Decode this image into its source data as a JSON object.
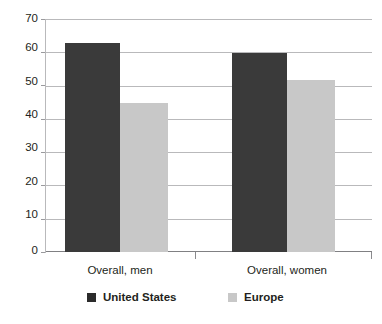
{
  "chart_data": {
    "type": "bar",
    "title": "",
    "xlabel": "",
    "ylabel": "",
    "ylim": [
      0,
      70
    ],
    "yticks": [
      0,
      10,
      20,
      30,
      40,
      50,
      60,
      70
    ],
    "grid": true,
    "legend_position": "bottom",
    "categories": [
      "Overall, men",
      "Overall, women"
    ],
    "series": [
      {
        "name": "United States",
        "color": "#3a3a3a",
        "values": [
          63,
          60
        ]
      },
      {
        "name": "Europe",
        "color": "#c8c8c8",
        "values": [
          45,
          52
        ]
      }
    ]
  },
  "axis": {
    "y_tick_labels": [
      "70",
      "60",
      "50",
      "40",
      "30",
      "20",
      "10",
      "0"
    ]
  },
  "categories": [
    {
      "label": "Overall, men"
    },
    {
      "label": "Overall, women"
    }
  ],
  "legend": {
    "items": [
      {
        "label": "United States",
        "swatch": "us"
      },
      {
        "label": "Europe",
        "swatch": "eu"
      }
    ]
  }
}
